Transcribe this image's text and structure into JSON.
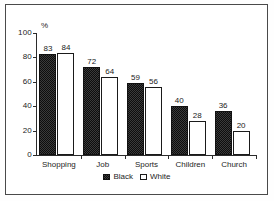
{
  "chart_data": {
    "type": "bar",
    "title": "",
    "xlabel": "",
    "ylabel": "%",
    "ylim": [
      0,
      100
    ],
    "yticks": [
      0,
      20,
      40,
      60,
      80,
      100
    ],
    "grid": false,
    "legend_position": "bottom-center",
    "categories": [
      "Shopping",
      "Job",
      "Sports",
      "Children",
      "Church"
    ],
    "series": [
      {
        "name": "Black",
        "values": [
          83,
          72,
          59,
          40,
          36
        ]
      },
      {
        "name": "White",
        "values": [
          84,
          64,
          56,
          28,
          20
        ]
      }
    ]
  },
  "legend": {
    "items": [
      {
        "label": "Black",
        "swatch": "filled-dark-pattern"
      },
      {
        "label": "White",
        "swatch": "open-white"
      }
    ]
  }
}
